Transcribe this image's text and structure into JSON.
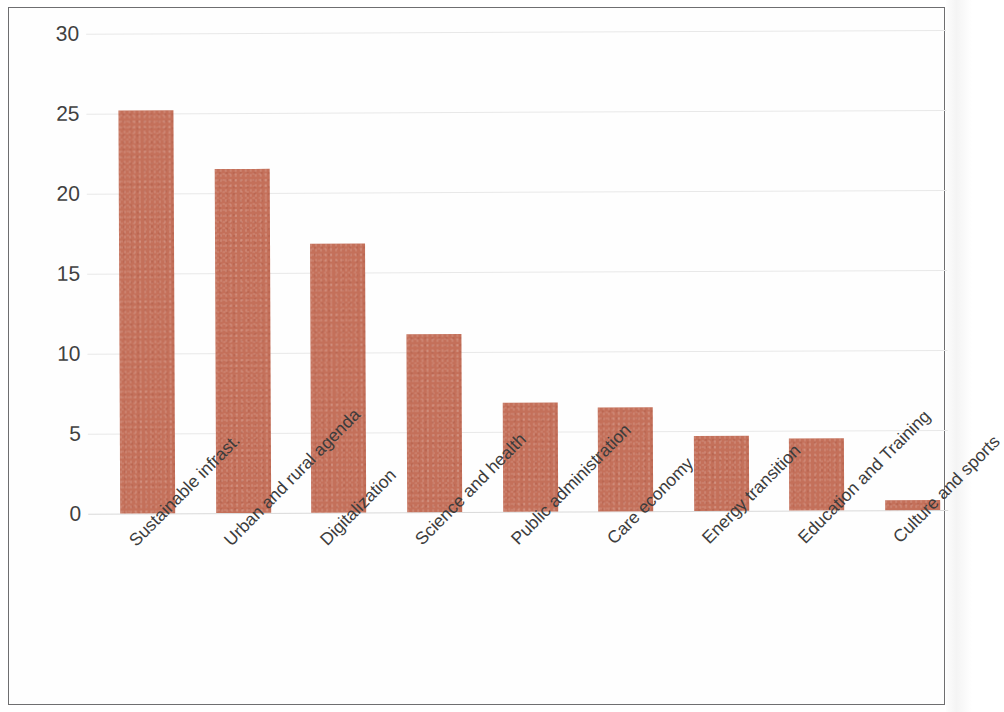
{
  "chart_data": {
    "type": "bar",
    "title": "",
    "subtitle": "",
    "xlabel": "",
    "ylabel": "",
    "ylim": [
      0,
      30
    ],
    "yticks": [
      0,
      5,
      10,
      15,
      20,
      25,
      30
    ],
    "ytick_labels": [
      "0",
      "5",
      "10",
      "15",
      "20",
      "25",
      "30"
    ],
    "grid": true,
    "legend": false,
    "legend_position": "none",
    "bar_color": "#c4705a",
    "categories": [
      "Sustainable infrast.",
      "Urban and rural agenda",
      "Digitalization",
      "Science and health",
      "Public administration",
      "Care economy",
      "Energy transition",
      "Education and Training",
      "Culture and sports"
    ],
    "values": [
      25.2,
      21.5,
      16.8,
      11.1,
      6.8,
      6.5,
      4.7,
      4.5,
      0.6
    ],
    "xtick_label_rotation": -45,
    "annotations": []
  },
  "frame": {
    "border_color": "#6e6e70",
    "background_color": "#ffffff"
  }
}
